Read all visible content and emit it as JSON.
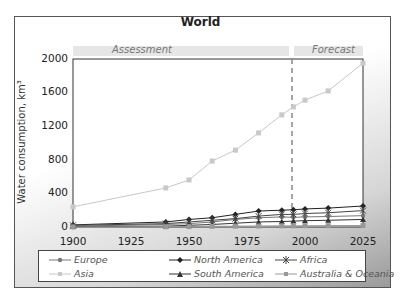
{
  "chart_data": {
    "type": "line",
    "title": "World",
    "xlabel": "",
    "ylabel": "Water consumption, km³",
    "xlim": [
      1900,
      2025
    ],
    "ylim": [
      0,
      2000
    ],
    "x_ticks": [
      1900,
      1925,
      1950,
      1975,
      2000,
      2025
    ],
    "y_ticks": [
      0,
      400,
      800,
      1200,
      1600,
      2000
    ],
    "grid": false,
    "legend_position": "bottom",
    "annotations": [
      {
        "text": "Assessment",
        "region": [
          1900,
          1995
        ]
      },
      {
        "text": "Forecast",
        "region": [
          1995,
          2025
        ]
      },
      {
        "type": "vertical-dashed-line",
        "x": 1995
      }
    ],
    "x": [
      1900,
      1940,
      1950,
      1960,
      1970,
      1980,
      1990,
      1995,
      2000,
      2010,
      2025
    ],
    "series": [
      {
        "name": "Europe",
        "marker": "circle",
        "color": "#777777",
        "values": [
          10,
          30,
          40,
          60,
          90,
          110,
          120,
          115,
          120,
          125,
          135
        ]
      },
      {
        "name": "North America",
        "marker": "diamond",
        "color": "#222222",
        "values": [
          25,
          60,
          90,
          110,
          150,
          190,
          200,
          205,
          215,
          225,
          250
        ]
      },
      {
        "name": "Africa",
        "marker": "asterisk",
        "color": "#444444",
        "values": [
          20,
          40,
          60,
          80,
          100,
          130,
          150,
          150,
          160,
          170,
          195
        ]
      },
      {
        "name": "Asia",
        "marker": "square",
        "color": "#c8c8c8",
        "values": [
          240,
          465,
          560,
          785,
          915,
          1120,
          1335,
          1430,
          1510,
          1620,
          1950
        ]
      },
      {
        "name": "South America",
        "marker": "triangle",
        "color": "#333333",
        "values": [
          5,
          10,
          20,
          30,
          45,
          60,
          65,
          70,
          75,
          80,
          90
        ]
      },
      {
        "name": "Australia & Oceania",
        "marker": "square",
        "color": "#999999",
        "values": [
          1,
          3,
          5,
          8,
          10,
          12,
          14,
          14,
          15,
          16,
          18
        ]
      }
    ]
  },
  "labels": {
    "title": "World",
    "assessment": "Assessment",
    "forecast": "Forecast",
    "ylabel": "Water consumption, km³",
    "yticks": [
      "0",
      "400",
      "800",
      "1200",
      "1600",
      "2000"
    ],
    "xticks": [
      "1900",
      "1925",
      "1950",
      "1975",
      "2000",
      "2025"
    ]
  },
  "legend": {
    "items": [
      {
        "label": "Europe"
      },
      {
        "label": "North America"
      },
      {
        "label": "Africa"
      },
      {
        "label": "Asia"
      },
      {
        "label": "South America"
      },
      {
        "label": "Australia & Oceania"
      }
    ]
  }
}
